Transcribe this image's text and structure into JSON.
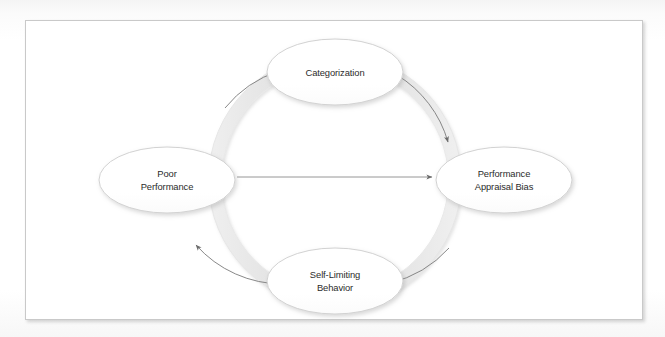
{
  "figure": {
    "type": "cycle-diagram",
    "title": "",
    "direction": "clockwise",
    "frame_border_color": "#c9c9c9",
    "ring_color": "#dedede",
    "ring_edge_color": "#c4c4c4",
    "arrow_line_color": "#6b6b6b",
    "node_fill": "#ffffff",
    "node_border_color": "#d2d2d2",
    "text_color": "#2b2b2b"
  },
  "nodes": [
    {
      "id": "categorization",
      "position": "top",
      "lines": [
        "Categorization"
      ],
      "line1": "Categorization",
      "line2": "",
      "cx": 335,
      "cy": 72,
      "rx": 68,
      "ry": 33
    },
    {
      "id": "performance-appraisal-bias",
      "position": "right",
      "lines": [
        "Performance",
        "Appraisal Bias"
      ],
      "line1": "Performance",
      "line2": "Appraisal Bias",
      "cx": 504,
      "cy": 180,
      "rx": 68,
      "ry": 33
    },
    {
      "id": "self-limiting-behavior",
      "position": "bottom",
      "lines": [
        "Self-Limiting",
        "Behavior"
      ],
      "line1": "Self-Limiting",
      "line2": "Behavior",
      "cx": 335,
      "cy": 281,
      "rx": 68,
      "ry": 33
    },
    {
      "id": "poor-performance",
      "position": "left",
      "lines": [
        "Poor",
        "Performance"
      ],
      "line1": "Poor",
      "line2": "Performance",
      "cx": 167,
      "cy": 180,
      "rx": 68,
      "ry": 33
    }
  ],
  "connectors": [
    {
      "id": "arc-poor-to-categorization",
      "kind": "arc",
      "from": "poor-performance",
      "to": "categorization",
      "label": ""
    },
    {
      "id": "arc-categorization-to-appraisal",
      "kind": "arc",
      "from": "categorization",
      "to": "performance-appraisal-bias",
      "label": ""
    },
    {
      "id": "arc-appraisal-to-self-limiting",
      "kind": "arc",
      "from": "performance-appraisal-bias",
      "to": "self-limiting-behavior",
      "label": ""
    },
    {
      "id": "arc-self-limiting-to-poor",
      "kind": "arc",
      "from": "self-limiting-behavior",
      "to": "poor-performance",
      "label": ""
    },
    {
      "id": "straight-poor-to-appraisal",
      "kind": "straight",
      "from": "poor-performance",
      "to": "performance-appraisal-bias",
      "label": ""
    }
  ]
}
